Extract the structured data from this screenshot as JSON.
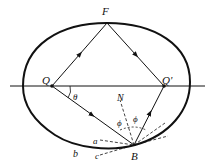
{
  "diagram": {
    "labels": {
      "F": "F",
      "Q": "Q",
      "Q_prime": "Q'",
      "N": "N",
      "theta": "θ",
      "phi_left": "ϕ",
      "phi_right": "ϕ",
      "a": "a",
      "b": "b",
      "c": "c",
      "B": "B"
    },
    "colors": {
      "stroke": "#111111",
      "background": "#ffffff"
    }
  }
}
